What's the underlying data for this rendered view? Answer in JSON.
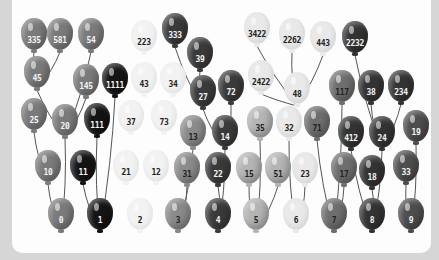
{
  "diagram": {
    "colors": {
      "red": "#7a7a7a",
      "black": "#141414",
      "white": "#f2f2f2",
      "orange": "#8a8a8a",
      "navy": "#3a3a3a",
      "yellow": "#b4b4b4",
      "cream": "#e9e9e9",
      "brown": "#6e6e6e",
      "dark": "#333333",
      "plum": "#4d4d4d"
    },
    "balloons": [
      {
        "id": "b335",
        "label": "335",
        "x": 21,
        "y": 18,
        "color": "red",
        "text": "light"
      },
      {
        "id": "b581",
        "label": "581",
        "x": 47,
        "y": 18,
        "color": "red",
        "text": "light"
      },
      {
        "id": "b54",
        "label": "54",
        "x": 78,
        "y": 18,
        "color": "red",
        "text": "light"
      },
      {
        "id": "b45",
        "label": "45",
        "x": 24,
        "y": 56,
        "color": "red",
        "text": "light"
      },
      {
        "id": "b145",
        "label": "145",
        "x": 73,
        "y": 64,
        "color": "red",
        "text": "light"
      },
      {
        "id": "b1111",
        "label": "1111",
        "x": 102,
        "y": 63,
        "color": "black",
        "text": "light"
      },
      {
        "id": "b25",
        "label": "25",
        "x": 21,
        "y": 98,
        "color": "red",
        "text": "light"
      },
      {
        "id": "b20",
        "label": "20",
        "x": 52,
        "y": 104,
        "color": "red",
        "text": "light"
      },
      {
        "id": "b111",
        "label": "111",
        "x": 84,
        "y": 103,
        "color": "black",
        "text": "light"
      },
      {
        "id": "b10",
        "label": "10",
        "x": 35,
        "y": 150,
        "color": "red",
        "text": "light"
      },
      {
        "id": "b11",
        "label": "11",
        "x": 70,
        "y": 150,
        "color": "black",
        "text": "light"
      },
      {
        "id": "b0",
        "label": "0",
        "x": 48,
        "y": 198,
        "color": "red",
        "text": "light"
      },
      {
        "id": "b1",
        "label": "1",
        "x": 87,
        "y": 198,
        "color": "black",
        "text": "light"
      },
      {
        "id": "b223",
        "label": "223",
        "x": 131,
        "y": 20,
        "color": "white",
        "text": "dark"
      },
      {
        "id": "b43",
        "label": "43",
        "x": 131,
        "y": 62,
        "color": "white",
        "text": "dark"
      },
      {
        "id": "b34",
        "label": "34",
        "x": 160,
        "y": 62,
        "color": "white",
        "text": "dark"
      },
      {
        "id": "b37",
        "label": "37",
        "x": 118,
        "y": 100,
        "color": "white",
        "text": "dark"
      },
      {
        "id": "b73",
        "label": "73",
        "x": 151,
        "y": 100,
        "color": "white",
        "text": "dark"
      },
      {
        "id": "b21",
        "label": "21",
        "x": 113,
        "y": 150,
        "color": "white",
        "text": "dark"
      },
      {
        "id": "b12",
        "label": "12",
        "x": 143,
        "y": 150,
        "color": "white",
        "text": "dark"
      },
      {
        "id": "b2",
        "label": "2",
        "x": 127,
        "y": 198,
        "color": "white",
        "text": "dark"
      },
      {
        "id": "b333",
        "label": "333",
        "x": 162,
        "y": 13,
        "color": "navy",
        "text": "light"
      },
      {
        "id": "b39",
        "label": "39",
        "x": 187,
        "y": 37,
        "color": "navy",
        "text": "light"
      },
      {
        "id": "b27",
        "label": "27",
        "x": 190,
        "y": 75,
        "color": "navy",
        "text": "light"
      },
      {
        "id": "b72",
        "label": "72",
        "x": 218,
        "y": 70,
        "color": "navy",
        "text": "light"
      },
      {
        "id": "b13",
        "label": "13",
        "x": 180,
        "y": 115,
        "color": "orange",
        "text": "dark"
      },
      {
        "id": "b14",
        "label": "14",
        "x": 212,
        "y": 115,
        "color": "navy",
        "text": "light"
      },
      {
        "id": "b31",
        "label": "31",
        "x": 174,
        "y": 152,
        "color": "orange",
        "text": "dark"
      },
      {
        "id": "b22",
        "label": "22",
        "x": 205,
        "y": 152,
        "color": "navy",
        "text": "light"
      },
      {
        "id": "b3",
        "label": "3",
        "x": 165,
        "y": 198,
        "color": "orange",
        "text": "dark"
      },
      {
        "id": "b4",
        "label": "4",
        "x": 205,
        "y": 198,
        "color": "navy",
        "text": "light"
      },
      {
        "id": "b3422",
        "label": "3422",
        "x": 244,
        "y": 12,
        "color": "cream",
        "text": "dark"
      },
      {
        "id": "b2262",
        "label": "2262",
        "x": 279,
        "y": 18,
        "color": "cream",
        "text": "dark"
      },
      {
        "id": "b443",
        "label": "443",
        "x": 310,
        "y": 21,
        "color": "cream",
        "text": "dark"
      },
      {
        "id": "b2422",
        "label": "2422",
        "x": 248,
        "y": 60,
        "color": "cream",
        "text": "dark"
      },
      {
        "id": "b48",
        "label": "48",
        "x": 284,
        "y": 72,
        "color": "cream",
        "text": "dark"
      },
      {
        "id": "b35",
        "label": "35",
        "x": 247,
        "y": 106,
        "color": "yellow",
        "text": "dark"
      },
      {
        "id": "b32",
        "label": "32",
        "x": 276,
        "y": 106,
        "color": "cream",
        "text": "dark"
      },
      {
        "id": "b15",
        "label": "15",
        "x": 236,
        "y": 152,
        "color": "yellow",
        "text": "dark"
      },
      {
        "id": "b51",
        "label": "51",
        "x": 265,
        "y": 152,
        "color": "yellow",
        "text": "dark"
      },
      {
        "id": "b23",
        "label": "23",
        "x": 292,
        "y": 152,
        "color": "cream",
        "text": "dark"
      },
      {
        "id": "b5",
        "label": "5",
        "x": 243,
        "y": 198,
        "color": "yellow",
        "text": "dark"
      },
      {
        "id": "b6",
        "label": "6",
        "x": 283,
        "y": 198,
        "color": "cream",
        "text": "dark"
      },
      {
        "id": "b2232",
        "label": "2232",
        "x": 342,
        "y": 21,
        "color": "dark",
        "text": "light"
      },
      {
        "id": "b117",
        "label": "117",
        "x": 329,
        "y": 70,
        "color": "brown",
        "text": "dark"
      },
      {
        "id": "b38",
        "label": "38",
        "x": 358,
        "y": 70,
        "color": "dark",
        "text": "light"
      },
      {
        "id": "b234",
        "label": "234",
        "x": 388,
        "y": 70,
        "color": "dark",
        "text": "light"
      },
      {
        "id": "b71",
        "label": "71",
        "x": 304,
        "y": 106,
        "color": "brown",
        "text": "dark"
      },
      {
        "id": "b412",
        "label": "412",
        "x": 338,
        "y": 116,
        "color": "dark",
        "text": "light"
      },
      {
        "id": "b24",
        "label": "24",
        "x": 369,
        "y": 116,
        "color": "dark",
        "text": "light"
      },
      {
        "id": "b19",
        "label": "19",
        "x": 403,
        "y": 110,
        "color": "plum",
        "text": "light"
      },
      {
        "id": "b17",
        "label": "17",
        "x": 331,
        "y": 152,
        "color": "brown",
        "text": "dark"
      },
      {
        "id": "b18",
        "label": "18",
        "x": 359,
        "y": 155,
        "color": "dark",
        "text": "light"
      },
      {
        "id": "b33",
        "label": "33",
        "x": 393,
        "y": 150,
        "color": "plum",
        "text": "light"
      },
      {
        "id": "b7",
        "label": "7",
        "x": 321,
        "y": 198,
        "color": "brown",
        "text": "dark"
      },
      {
        "id": "b8",
        "label": "8",
        "x": 359,
        "y": 198,
        "color": "dark",
        "text": "light"
      },
      {
        "id": "b9",
        "label": "9",
        "x": 398,
        "y": 198,
        "color": "plum",
        "text": "light"
      }
    ],
    "strings": [
      [
        "b335",
        "b45"
      ],
      [
        "b581",
        "b45"
      ],
      [
        "b54",
        "b20"
      ],
      [
        "b45",
        "b20"
      ],
      [
        "b145",
        "b20"
      ],
      [
        "b25",
        "b10"
      ],
      [
        "b20",
        "b0"
      ],
      [
        "b10",
        "b0"
      ],
      [
        "b1111",
        "b1"
      ],
      [
        "b111",
        "b1"
      ],
      [
        "b11",
        "b1"
      ],
      [
        "b333",
        "b27"
      ],
      [
        "b39",
        "b27"
      ],
      [
        "b27",
        "b14"
      ],
      [
        "b72",
        "b14"
      ],
      [
        "b13",
        "b3"
      ],
      [
        "b31",
        "b3"
      ],
      [
        "b14",
        "b4"
      ],
      [
        "b22",
        "b4"
      ],
      [
        "b3422",
        "b48"
      ],
      [
        "b2262",
        "b48"
      ],
      [
        "b443",
        "b48"
      ],
      [
        "b2422",
        "b48"
      ],
      [
        "b35",
        "b5"
      ],
      [
        "b15",
        "b5"
      ],
      [
        "b51",
        "b5"
      ],
      [
        "b32",
        "b6"
      ],
      [
        "b23",
        "b6"
      ],
      [
        "b2232",
        "b24"
      ],
      [
        "b38",
        "b24"
      ],
      [
        "b234",
        "b24"
      ],
      [
        "b117",
        "b7"
      ],
      [
        "b71",
        "b7"
      ],
      [
        "b17",
        "b7"
      ],
      [
        "b412",
        "b8"
      ],
      [
        "b24",
        "b8"
      ],
      [
        "b18",
        "b8"
      ],
      [
        "b19",
        "b9"
      ],
      [
        "b33",
        "b9"
      ]
    ]
  }
}
